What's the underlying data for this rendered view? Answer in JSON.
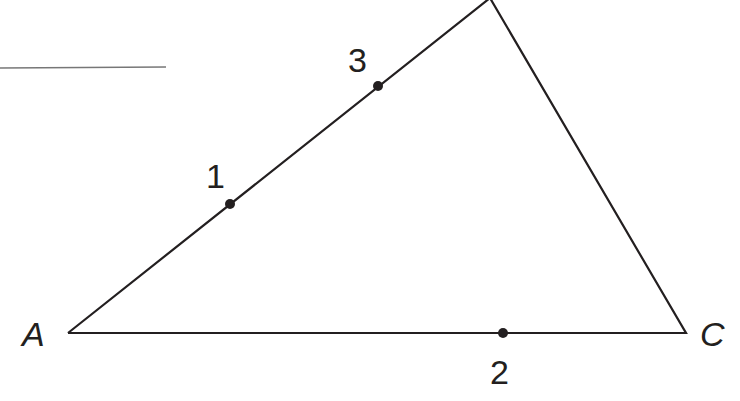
{
  "diagram": {
    "type": "triangle",
    "vertices": {
      "A": {
        "label": "A",
        "x": 68,
        "y": 333
      },
      "B": {
        "label": "",
        "x": 490,
        "y": -2
      },
      "C": {
        "label": "C",
        "x": 686,
        "y": 333
      }
    },
    "points": [
      {
        "label": "1",
        "x": 230,
        "y": 204,
        "on_side": "AB"
      },
      {
        "label": "2",
        "x": 503,
        "y": 333,
        "on_side": "AC"
      },
      {
        "label": "3",
        "x": 378,
        "y": 86,
        "on_side": "AB"
      }
    ],
    "answer_line": {
      "x1": 0,
      "y1": 68,
      "x2": 166,
      "y2": 67
    },
    "colors": {
      "stroke": "#231f20",
      "answer_line": "#777777",
      "background": "#ffffff"
    }
  }
}
